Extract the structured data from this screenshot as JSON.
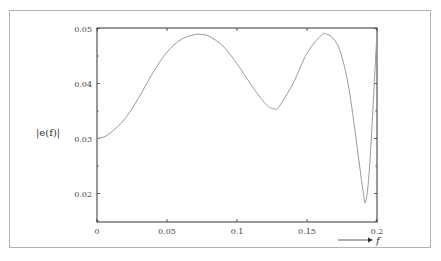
{
  "chart_data": {
    "type": "line",
    "title": "",
    "xlabel": "f",
    "ylabel": "|e(f)|",
    "xlim": [
      0,
      0.2
    ],
    "ylim": [
      0.0148,
      0.05
    ],
    "grid": false,
    "legend": null,
    "x_ticks": [
      "0",
      "0.05",
      "0.1",
      "0.15",
      "0.2"
    ],
    "y_ticks": [
      "0.02",
      "0.03",
      "0.04",
      "0.05"
    ],
    "series": [
      {
        "name": "|e(f)|",
        "color": "#9a9a9a",
        "x": [
          0,
          0.005,
          0.01,
          0.02,
          0.03,
          0.04,
          0.05,
          0.06,
          0.07,
          0.075,
          0.08,
          0.09,
          0.1,
          0.11,
          0.12,
          0.126,
          0.13,
          0.14,
          0.15,
          0.16,
          0.164,
          0.17,
          0.175,
          0.18,
          0.185,
          0.19,
          0.192,
          0.195,
          0.2
        ],
        "values": [
          0.03,
          0.0303,
          0.0311,
          0.0336,
          0.0375,
          0.042,
          0.0457,
          0.048,
          0.0489,
          0.0489,
          0.0486,
          0.0468,
          0.0436,
          0.0398,
          0.0364,
          0.0354,
          0.0358,
          0.04,
          0.0455,
          0.0487,
          0.049,
          0.0478,
          0.0448,
          0.039,
          0.03,
          0.0205,
          0.0186,
          0.026,
          0.0495
        ]
      }
    ]
  },
  "axes": {
    "x_ticks": [
      {
        "label": "0",
        "value": 0
      },
      {
        "label": "0.05",
        "value": 0.05
      },
      {
        "label": "0.1",
        "value": 0.1
      },
      {
        "label": "0.15",
        "value": 0.15
      },
      {
        "label": "0.2",
        "value": 0.2
      }
    ],
    "y_ticks": [
      {
        "label": "0.02",
        "value": 0.02
      },
      {
        "label": "0.03",
        "value": 0.03
      },
      {
        "label": "0.04",
        "value": 0.04
      },
      {
        "label": "0.05",
        "value": 0.05
      }
    ],
    "y_minor": [
      0.015,
      0.025,
      0.035,
      0.045
    ],
    "xlabel": "f",
    "ylabel": "|e(f)|"
  }
}
